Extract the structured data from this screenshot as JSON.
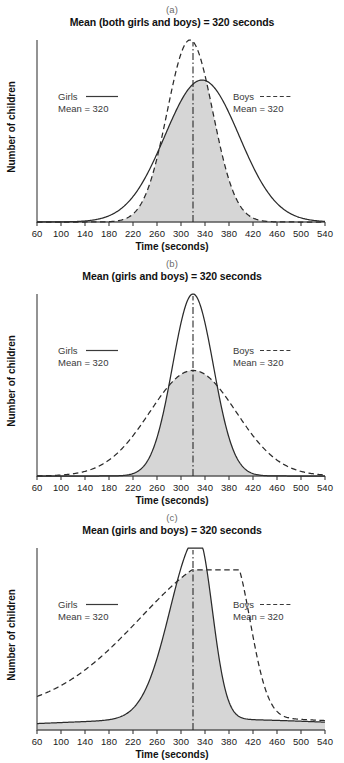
{
  "figure": {
    "ylabel": "Number of children",
    "xlabel": "Time (seconds)",
    "shaded_color": "#d6d6d6",
    "line_color": "#2b2b2b"
  },
  "panels": [
    {
      "label": "(a)",
      "title": "Mean (both girls and boys) = 320 seconds",
      "legend_girls_name": "Girls",
      "legend_girls_mean": "Mean = 320",
      "legend_boys_name": "Boys",
      "legend_boys_mean": "Mean = 320"
    },
    {
      "label": "(b)",
      "title": "Mean (girls and boys) = 320 seconds",
      "legend_girls_name": "Girls",
      "legend_girls_mean": "Mean = 320",
      "legend_boys_name": "Boys",
      "legend_boys_mean": "Mean = 320"
    },
    {
      "label": "(c)",
      "title": "Mean (girls and boys) = 320 seconds",
      "legend_girls_name": "Girls",
      "legend_girls_mean": "Mean = 320",
      "legend_boys_name": "Boys",
      "legend_boys_mean": "Mean = 320"
    }
  ],
  "chart_data": [
    {
      "type": "area",
      "title": "Mean (both girls and boys) = 320 seconds",
      "panel": "(a)",
      "xlabel": "Time (seconds)",
      "ylabel": "Number of children",
      "xlim": [
        60,
        540
      ],
      "ylim": [
        0,
        1.05
      ],
      "xticks": [
        60,
        100,
        140,
        180,
        220,
        260,
        300,
        340,
        380,
        420,
        460,
        500,
        540
      ],
      "grid": false,
      "legend": [
        "Girls",
        "Boys"
      ],
      "annotations": [
        "Mean = 320 (girls)",
        "Mean = 320 (boys)",
        "vertical dash-dot line at 320"
      ],
      "mean_line_x": 320,
      "series": [
        {
          "name": "Girls",
          "style": "solid",
          "distribution": "normal",
          "mean": 335,
          "sd": 62,
          "peak": 0.78
        },
        {
          "name": "Boys",
          "style": "dashed",
          "distribution": "normal",
          "mean": 315,
          "sd": 38,
          "peak": 1.0
        }
      ],
      "shaded_region": "overlap (minimum) of Girls and Boys curves"
    },
    {
      "type": "area",
      "title": "Mean (girls and boys) = 320 seconds",
      "panel": "(b)",
      "xlabel": "Time (seconds)",
      "ylabel": "Number of children",
      "xlim": [
        60,
        540
      ],
      "ylim": [
        0,
        1.05
      ],
      "xticks": [
        60,
        100,
        140,
        180,
        220,
        260,
        300,
        340,
        380,
        420,
        460,
        500,
        540
      ],
      "grid": false,
      "legend": [
        "Girls",
        "Boys"
      ],
      "annotations": [
        "Mean = 320 (girls)",
        "Mean = 320 (boys)",
        "vertical dash-dot line at 320"
      ],
      "mean_line_x": 320,
      "series": [
        {
          "name": "Girls",
          "style": "solid",
          "distribution": "normal",
          "mean": 320,
          "sd": 34,
          "peak": 1.0
        },
        {
          "name": "Boys",
          "style": "dashed",
          "distribution": "normal",
          "mean": 320,
          "sd": 72,
          "peak": 0.58
        }
      ],
      "shaded_region": "overlap (minimum) of Girls and Boys curves"
    },
    {
      "type": "area",
      "title": "Mean (girls and boys) = 320 seconds",
      "panel": "(c)",
      "xlabel": "Time (seconds)",
      "ylabel": "Number of children",
      "xlim": [
        60,
        540
      ],
      "ylim": [
        0,
        1.05
      ],
      "xticks": [
        60,
        100,
        140,
        180,
        220,
        260,
        300,
        340,
        380,
        420,
        460,
        500,
        540
      ],
      "grid": false,
      "legend": [
        "Girls",
        "Boys"
      ],
      "annotations": [
        "Mean = 320 (girls)",
        "Mean = 320 (boys)",
        "vertical dash-dot line at 320"
      ],
      "mean_line_x": 320,
      "series": [
        {
          "name": "Girls",
          "style": "solid",
          "distribution": "skewed-right-peak",
          "peak_x": 328,
          "peak": 1.0,
          "left_sd": 46,
          "right_sd": 24,
          "tail": 0.06
        },
        {
          "name": "Boys",
          "style": "dashed",
          "distribution": "broad-left-tail-peak",
          "peak_x": 385,
          "peak": 0.88,
          "left_sd": 150,
          "right_sd": 30,
          "baseline": 0.1
        }
      ],
      "shaded_region": "overlap (minimum) of Girls and Boys curves"
    }
  ]
}
